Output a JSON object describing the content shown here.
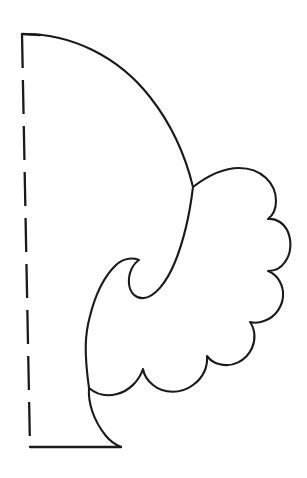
{
  "page": {
    "background_color": "#ffffff",
    "ink_color": "#1a1a1a",
    "width": 307,
    "height": 478
  },
  "drawing": {
    "name": "half-pattern-scalloped-leaf",
    "description": "Line-art cutting pattern: half of a symmetrical scalloped leaf / wing motif, drawn to the right of a vertical dashed fold line.",
    "stroke_color": "#1a1a1a",
    "fill": "none",
    "line_weight_px": 2.1
  },
  "fold_line": {
    "name": "fold-line",
    "style": "dashed",
    "dash_length_px": 34,
    "gap_length_px": 12,
    "dash_count": 9,
    "start": {
      "x": 22,
      "y": 34
    },
    "end": {
      "x": 30,
      "y": 447
    }
  },
  "base_line": {
    "name": "baseline",
    "style": "solid",
    "start": {
      "x": 30,
      "y": 447
    },
    "end": {
      "x": 121,
      "y": 447
    }
  },
  "top_tick": {
    "name": "top-edge-tick",
    "style": "solid",
    "start": {
      "x": 22,
      "y": 34
    },
    "end": {
      "x": 40,
      "y": 35
    }
  },
  "outline_paths": {
    "main_arc": "M 22 34 C 70 33 118 56 150 97 C 172 125 186 158 193 187",
    "scalloped_body": "M 193 187 C 206 177 222 168 239 168 C 261 168 276 183 276 201 C 276 210 272 216 268 219 C 276 218 284 223 288 232 C 292 242 291 254 285 262 C 281 268 274 271 268 271 C 276 274 282 282 283 292 C 284 305 276 317 264 321 C 259 323 254 323 250 322 C 255 329 256 339 252 348 C 246 361 232 368 219 364 C 214 363 210 360 207 356 C 208 367 203 378 193 385 C 181 394 164 394 153 385 C 148 381 144 375 143 369 C 139 381 129 391 117 394 C 106 397 96 394 89 388 C 88 402 93 420 106 436 C 111 442 116 445 121 447",
    "inner_notch": "M 193 187 C 190 212 184 240 175 262 C 166 284 154 297 144 298 C 136 299 130 293 129 284 C 128 273 133 264 139 260 C 131 257 122 259 115 266 C 104 277 95 296 90 316 C 85 334 84 352 89 388"
  },
  "shape_extents": {
    "leftmost_x": 22,
    "rightmost_x": 290,
    "topmost_y": 33,
    "bottommost_y": 448
  }
}
